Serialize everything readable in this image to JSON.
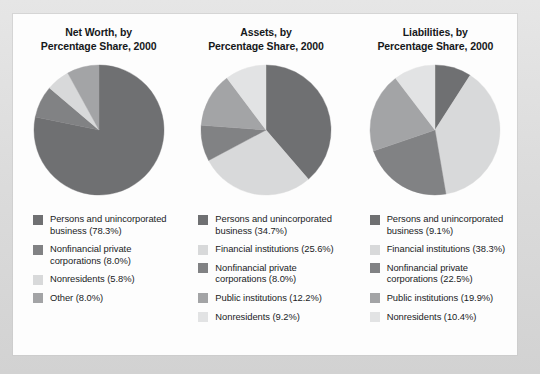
{
  "figure": {
    "background_color": "#dedede",
    "panel_color": "#fdfdfd"
  },
  "palette": {
    "persons_and_unincorporated_business": "#6f7072",
    "financial_institutions": "#d8d9da",
    "nonfinancial_private_corporations": "#818284",
    "public_institutions": "#a3a4a6",
    "nonresidents": "#c4c5c6",
    "other": "#9a9b9d"
  },
  "charts": [
    {
      "title": "Net Worth, by\nPercentage Share, 2000",
      "legend": [
        {
          "label": "Persons and unincorporated\nbusiness (78.3%)",
          "color": "#6f7072"
        },
        {
          "label": "Nonfinancial private\ncorporations (8.0%)",
          "color": "#818284"
        },
        {
          "label": "Nonresidents (5.8%)",
          "color": "#d8d9da"
        },
        {
          "label": "Other (8.0%)",
          "color": "#a3a4a6"
        }
      ]
    },
    {
      "title": "Assets, by\nPercentage Share, 2000",
      "legend": [
        {
          "label": "Persons and unincorporated\nbusiness (34.7%)",
          "color": "#6f7072"
        },
        {
          "label": "Financial institutions (25.6%)",
          "color": "#d8d9da"
        },
        {
          "label": "Nonfinancial private\ncorporations (8.0%)",
          "color": "#818284"
        },
        {
          "label": "Public institutions (12.2%)",
          "color": "#a3a4a6"
        },
        {
          "label": "Nonresidents (9.2%)",
          "color": "#e2e3e4"
        }
      ]
    },
    {
      "title": "Liabilities, by\nPercentage Share, 2000",
      "legend": [
        {
          "label": "Persons and unincorporated\nbusiness (9.1%)",
          "color": "#6f7072"
        },
        {
          "label": "Financial institutions (38.3%)",
          "color": "#d8d9da"
        },
        {
          "label": "Nonfinancial private\ncorporations (22.5%)",
          "color": "#818284"
        },
        {
          "label": "Public institutions (19.9%)",
          "color": "#a3a4a6"
        },
        {
          "label": "Nonresidents (10.4%)",
          "color": "#e2e3e4"
        }
      ]
    }
  ],
  "chart_data": [
    {
      "type": "pie",
      "title": "Net Worth, by Percentage Share, 2000",
      "labels": [
        "Persons and unincorporated business",
        "Nonfinancial private corporations",
        "Nonresidents",
        "Other"
      ],
      "values": [
        78.3,
        8.0,
        5.8,
        8.0
      ],
      "unit": "percent",
      "start_angle_deg": 0,
      "direction": "clockwise",
      "colors": [
        "#6f7072",
        "#818284",
        "#d8d9da",
        "#a3a4a6"
      ],
      "legend_position": "below"
    },
    {
      "type": "pie",
      "title": "Assets, by Percentage Share, 2000",
      "labels": [
        "Persons and unincorporated business",
        "Financial institutions",
        "Nonfinancial private corporations",
        "Public institutions",
        "Nonresidents"
      ],
      "values": [
        34.7,
        25.6,
        8.0,
        12.2,
        9.2
      ],
      "unit": "percent",
      "start_angle_deg": 0,
      "direction": "clockwise",
      "colors": [
        "#6f7072",
        "#d8d9da",
        "#818284",
        "#a3a4a6",
        "#e2e3e4"
      ],
      "legend_position": "below",
      "note": "Slice percentages shown sum to 89.7; remainder rendered within adjacent sectors as drawn."
    },
    {
      "type": "pie",
      "title": "Liabilities, by Percentage Share, 2000",
      "labels": [
        "Persons and unincorporated business",
        "Financial institutions",
        "Nonfinancial private corporations",
        "Public institutions",
        "Nonresidents"
      ],
      "values": [
        9.1,
        38.3,
        22.5,
        19.9,
        10.4
      ],
      "unit": "percent",
      "start_angle_deg": 0,
      "direction": "clockwise",
      "colors": [
        "#6f7072",
        "#d8d9da",
        "#818284",
        "#a3a4a6",
        "#e2e3e4"
      ],
      "legend_position": "below"
    }
  ]
}
